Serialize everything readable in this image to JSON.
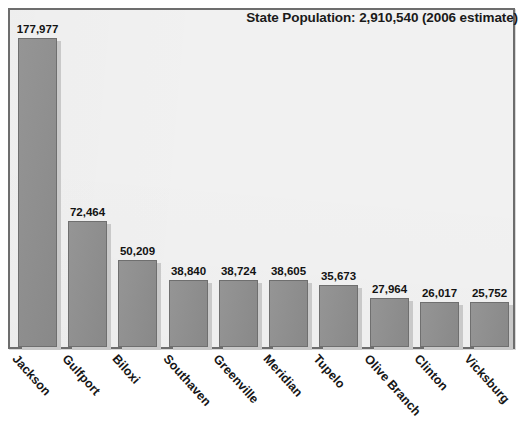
{
  "chart_data": {
    "type": "bar",
    "title": "State Population: 2,910,540 (2006 estimate)",
    "xlabel": "",
    "ylabel": "",
    "ylim": [
      0,
      190000
    ],
    "grid": false,
    "legend": "none",
    "orientation": "vertical",
    "categories": [
      "Jackson",
      "Gulfport",
      "Biloxi",
      "Southaven",
      "Greenville",
      "Meridian",
      "Tupelo",
      "Olive Branch",
      "Clinton",
      "Vicksburg"
    ],
    "values": [
      177977,
      72464,
      50209,
      38840,
      38724,
      38605,
      35673,
      27964,
      26017,
      25752
    ],
    "value_labels": [
      "177,977",
      "72,464",
      "50,209",
      "38,840",
      "38,724",
      "38,605",
      "35,673",
      "27,964",
      "26,017",
      "25,752"
    ],
    "colors": {
      "bar_fill": "#8d8d8d",
      "bar_border": "#6f6f6f",
      "bar_shadow": "#c9c9c9",
      "plot_background": "#f1f1f1",
      "frame_border": "#6d6d6d",
      "text": "#131313",
      "page_background": "#ffffff"
    }
  },
  "bars": [
    {
      "label": "Jackson",
      "value_label": "177,977"
    },
    {
      "label": "Gulfport",
      "value_label": "72,464"
    },
    {
      "label": "Biloxi",
      "value_label": "50,209"
    },
    {
      "label": "Southaven",
      "value_label": "38,840"
    },
    {
      "label": "Greenville",
      "value_label": "38,724"
    },
    {
      "label": "Meridian",
      "value_label": "38,605"
    },
    {
      "label": "Tupelo",
      "value_label": "35,673"
    },
    {
      "label": "Olive Branch",
      "value_label": "27,964"
    },
    {
      "label": "Clinton",
      "value_label": "26,017"
    },
    {
      "label": "Vicksburg",
      "value_label": "25,752"
    }
  ]
}
